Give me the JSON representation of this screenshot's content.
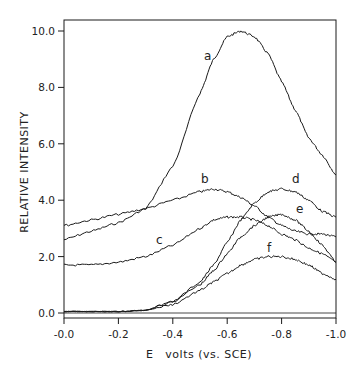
{
  "chart_data": {
    "type": "line",
    "title": "",
    "xlabel": "E   volts (vs. SCE)",
    "ylabel": "RELATIVE INTENSITY",
    "xlim": [
      0.0,
      -1.0
    ],
    "ylim": [
      0.0,
      10.0
    ],
    "x_ticks": [
      0.0,
      -0.2,
      -0.4,
      -0.6,
      -0.8,
      -1.0
    ],
    "x_tick_labels": [
      "-0.0",
      "-0.2",
      "-0.4",
      "-0.6",
      "-0.8",
      "-1.0"
    ],
    "y_ticks": [
      0.0,
      2.0,
      4.0,
      6.0,
      8.0,
      10.0
    ],
    "y_tick_labels": [
      "0.0",
      "2.0",
      "4.0",
      "6.0",
      "8.0",
      "10.0"
    ],
    "grid": false,
    "legend": "none (curves labeled inline a-f)",
    "x": [
      0.0,
      -0.1,
      -0.2,
      -0.3,
      -0.4,
      -0.5,
      -0.55,
      -0.6,
      -0.65,
      -0.7,
      -0.75,
      -0.8,
      -0.85,
      -0.9,
      -0.95,
      -1.0
    ],
    "series": [
      {
        "name": "a",
        "values": [
          2.6,
          2.9,
          3.2,
          3.7,
          5.2,
          7.8,
          9.0,
          9.8,
          10.0,
          9.8,
          9.2,
          8.2,
          7.2,
          6.2,
          5.6,
          4.9
        ]
      },
      {
        "name": "b",
        "values": [
          3.1,
          3.3,
          3.5,
          3.7,
          4.0,
          4.3,
          4.4,
          4.3,
          4.1,
          3.8,
          3.4,
          3.1,
          2.9,
          2.8,
          2.8,
          2.7
        ]
      },
      {
        "name": "c",
        "values": [
          1.7,
          1.7,
          1.8,
          2.0,
          2.4,
          3.0,
          3.3,
          3.4,
          3.4,
          3.3,
          3.1,
          2.8,
          2.6,
          2.3,
          2.1,
          1.8
        ]
      },
      {
        "name": "d",
        "values": [
          0.05,
          0.05,
          0.05,
          0.1,
          0.4,
          1.1,
          1.7,
          2.5,
          3.3,
          3.9,
          4.3,
          4.4,
          4.3,
          4.0,
          3.6,
          3.4
        ]
      },
      {
        "name": "e",
        "values": [
          0.05,
          0.05,
          0.05,
          0.1,
          0.4,
          1.0,
          1.5,
          2.1,
          2.7,
          3.1,
          3.4,
          3.5,
          3.3,
          2.9,
          2.4,
          1.8
        ]
      },
      {
        "name": "f",
        "values": [
          0.05,
          0.05,
          0.05,
          0.1,
          0.3,
          0.8,
          1.1,
          1.4,
          1.7,
          1.9,
          2.0,
          2.0,
          1.9,
          1.7,
          1.4,
          1.2
        ]
      }
    ],
    "annotations": [
      {
        "text": "a",
        "x": -0.56,
        "y": 9.3
      },
      {
        "text": "b",
        "x": -0.52,
        "y": 4.6
      },
      {
        "text": "c",
        "x": -0.35,
        "y": 2.3
      },
      {
        "text": "d",
        "x": -0.85,
        "y": 4.6
      },
      {
        "text": "e",
        "x": -0.86,
        "y": 3.5
      },
      {
        "text": "f",
        "x": -0.76,
        "y": 2.3
      }
    ]
  },
  "labels": {
    "a": "a",
    "b": "b",
    "c": "c",
    "d": "d",
    "e": "e",
    "f": "f",
    "xlabel": "E   volts (vs. SCE)",
    "ylabel": "RELATIVE INTENSITY",
    "xt0": "-0.0",
    "xt1": "-0.2",
    "xt2": "-0.4",
    "xt3": "-0.6",
    "xt4": "-0.8",
    "xt5": "-1.0",
    "yt0": "0.0",
    "yt1": "2.0",
    "yt2": "4.0",
    "yt3": "6.0",
    "yt4": "8.0",
    "yt5": "10.0"
  },
  "colors": {
    "ink": "#1a1a1a",
    "background": "#ffffff"
  }
}
